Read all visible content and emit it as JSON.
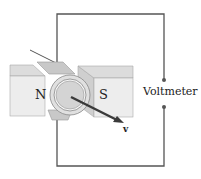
{
  "diagram": {
    "type": "physics-diagram",
    "labels": {
      "north_pole": "N",
      "south_pole": "S",
      "meter": "Voltmeter",
      "velocity": "v"
    },
    "colors": {
      "magnet_face": "#ececec",
      "magnet_top": "#d9d9d9",
      "magnet_side": "#c9c9c9",
      "conductor": "#bdbdbd",
      "wire": "#555555",
      "arrow": "#3a3a3a",
      "background": "#ffffff"
    }
  }
}
